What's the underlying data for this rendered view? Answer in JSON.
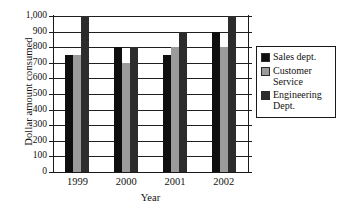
{
  "chart_data": {
    "type": "bar",
    "title": "",
    "xlabel": "Year",
    "ylabel": "Dollar amount consumed",
    "categories": [
      "1999",
      "2000",
      "2001",
      "2002"
    ],
    "series": [
      {
        "name": "Sales dept.",
        "color": "#100f0f",
        "values": [
          750,
          800,
          750,
          900
        ]
      },
      {
        "name": "Customer Service",
        "color": "#9b9b9b",
        "values": [
          750,
          700,
          800,
          800
        ]
      },
      {
        "name": "Engineering Dept.",
        "color": "#2c2c2c",
        "values": [
          1000,
          800,
          900,
          1000
        ]
      }
    ],
    "ylim": [
      0,
      1000
    ],
    "ytick_values": [
      0,
      100,
      200,
      300,
      400,
      500,
      600,
      700,
      800,
      900,
      1000
    ],
    "ytick_labels": [
      "0",
      "100",
      "200",
      "300",
      "400",
      "500",
      "600",
      "700",
      "800",
      "900",
      "1,000"
    ],
    "grid": true,
    "legend_position": "right",
    "legend_entries": [
      {
        "label": "Sales dept.",
        "color": "#100f0f"
      },
      {
        "label": "Customer\nService",
        "color": "#9b9b9b"
      },
      {
        "label": "Engineering\nDept.",
        "color": "#2c2c2c"
      }
    ]
  }
}
